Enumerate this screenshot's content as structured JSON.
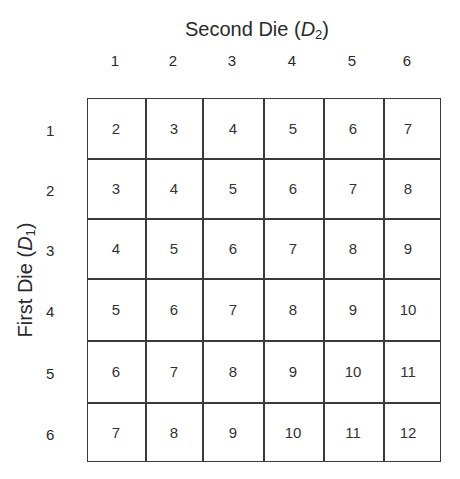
{
  "title": {
    "prefix": "Second Die (",
    "var": "D",
    "sub": "2",
    "suffix": ")"
  },
  "ylabel": {
    "prefix": "First Die (",
    "var": "D",
    "sub": "1",
    "suffix": ")"
  },
  "columns": [
    "1",
    "2",
    "3",
    "4",
    "5",
    "6"
  ],
  "rows": [
    "1",
    "2",
    "3",
    "4",
    "5",
    "6"
  ],
  "cells": [
    [
      "2",
      "3",
      "4",
      "5",
      "6",
      "7"
    ],
    [
      "3",
      "4",
      "5",
      "6",
      "7",
      "8"
    ],
    [
      "4",
      "5",
      "6",
      "7",
      "8",
      "9"
    ],
    [
      "5",
      "6",
      "7",
      "8",
      "9",
      "10"
    ],
    [
      "6",
      "7",
      "8",
      "9",
      "10",
      "11"
    ],
    [
      "7",
      "8",
      "9",
      "10",
      "11",
      "12"
    ]
  ]
}
